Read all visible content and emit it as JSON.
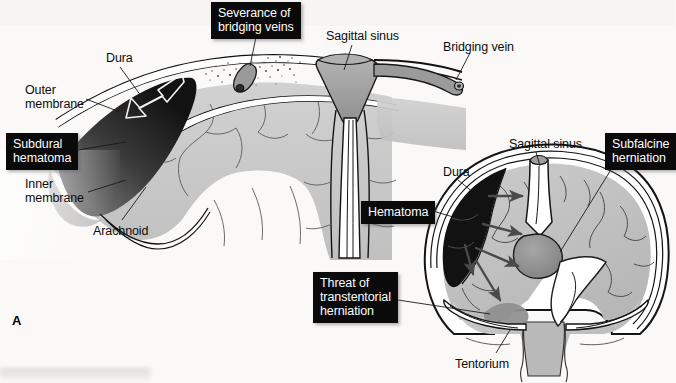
{
  "figure": {
    "panel_letter": "A",
    "background_color": "#faf9f7",
    "ink_color": "#0d0d0d",
    "callout_bg": "#0a0a0a",
    "callout_fg": "#fdfdfd",
    "brain_gray": "#c2c2c2",
    "vessel_gray": "#9d9d9d",
    "hematoma_black": "#111111"
  },
  "top_panel": {
    "callouts": [
      {
        "id": "severance",
        "text": "Severance of\nbridging veins",
        "x": 211,
        "y": 2
      }
    ],
    "callouts_left": [
      {
        "id": "subdural-hematoma",
        "text": "Subdural\nhematoma",
        "x": 6,
        "y": 133
      }
    ],
    "labels": [
      {
        "id": "dura",
        "text": "Dura",
        "x": 106,
        "y": 52
      },
      {
        "id": "outer-membrane",
        "text": "Outer\nmembrane",
        "x": 25,
        "y": 84
      },
      {
        "id": "inner-membrane",
        "text": "Inner\nmembrane",
        "x": 25,
        "y": 178
      },
      {
        "id": "arachnoid",
        "text": "Arachnoid",
        "x": 93,
        "y": 225
      },
      {
        "id": "sagittal-sinus-top",
        "text": "Sagittal sinus",
        "x": 326,
        "y": 30
      },
      {
        "id": "bridging-vein",
        "text": "Bridging vein",
        "x": 443,
        "y": 41
      }
    ]
  },
  "bottom_panel": {
    "callouts": [
      {
        "id": "hematoma",
        "text": "Hematoma",
        "x": 361,
        "y": 201
      },
      {
        "id": "subfalcine-herniation",
        "text": "Subfalcine\nherniation",
        "x": 605,
        "y": 133
      },
      {
        "id": "threat-transtentorial",
        "text": "Threat of\ntranstentorial\nherniation",
        "x": 313,
        "y": 272
      }
    ],
    "labels": [
      {
        "id": "sagittal-sinus-bottom",
        "text": "Sagittal sinus",
        "x": 509,
        "y": 138
      },
      {
        "id": "dura-bottom",
        "text": "Dura",
        "x": 443,
        "y": 166
      },
      {
        "id": "tentorium",
        "text": "Tentorium",
        "x": 455,
        "y": 358
      }
    ]
  }
}
